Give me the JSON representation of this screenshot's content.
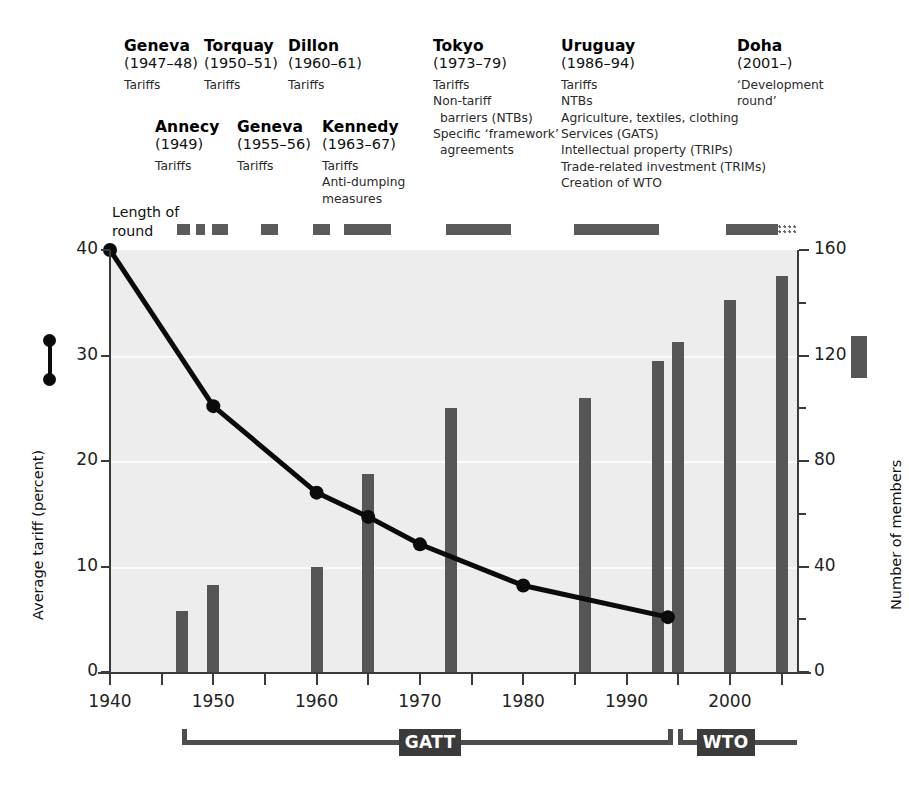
{
  "rounds_top": [
    {
      "name": "Geneva",
      "years": "(1947–48)",
      "topics": [
        "Tariffs"
      ],
      "x": 124,
      "y": 38
    },
    {
      "name": "Torquay",
      "years": "(1950–51)",
      "topics": [
        "Tariffs"
      ],
      "x": 204,
      "y": 38
    },
    {
      "name": "Dillon",
      "years": "(1960–61)",
      "topics": [
        "Tariffs"
      ],
      "x": 288,
      "y": 38
    },
    {
      "name": "Tokyo",
      "years": "(1973–79)",
      "topics": [
        "Tariffs",
        "Non-tariff",
        "barriers (NTBs)",
        "Specific ‘framework’",
        "agreements"
      ],
      "x": 433,
      "y": 38
    },
    {
      "name": "Uruguay",
      "years": "(1986–94)",
      "topics": [
        "Tariffs",
        "NTBs",
        "Agriculture, textiles, clothing",
        "Services (GATS)",
        "Intellectual property (TRIPs)",
        "Trade-related investment (TRIMs)",
        "Creation of WTO"
      ],
      "x": 561,
      "y": 38
    },
    {
      "name": "Doha",
      "years": "(2001–)",
      "topics": [
        "‘Development",
        "round’"
      ],
      "x": 737,
      "y": 38
    }
  ],
  "rounds_bottom": [
    {
      "name": "Annecy",
      "years": "(1949)",
      "topics": [
        "Tariffs"
      ],
      "x": 155,
      "y": 119
    },
    {
      "name": "Geneva",
      "years": "(1955–56)",
      "topics": [
        "Tariffs"
      ],
      "x": 237,
      "y": 119
    },
    {
      "name": "Kennedy",
      "years": "(1963–67)",
      "topics": [
        "Tariffs",
        "Anti-dumping",
        "measures"
      ],
      "x": 322,
      "y": 119
    }
  ],
  "length_of_round": {
    "label_line1": "Length of",
    "label_line2": "round",
    "bars": [
      {
        "round": "Geneva 1947-48",
        "x": 177,
        "w": 13
      },
      {
        "round": "Annecy 1949",
        "x": 196,
        "w": 9
      },
      {
        "round": "Torquay 1950-51",
        "x": 212,
        "w": 16
      },
      {
        "round": "Geneva 1955-56",
        "x": 261,
        "w": 17
      },
      {
        "round": "Dillon 1960-61",
        "x": 313,
        "w": 17
      },
      {
        "round": "Kennedy 1963-67",
        "x": 344,
        "w": 47
      },
      {
        "round": "Tokyo 1973-79",
        "x": 446,
        "w": 65
      },
      {
        "round": "Uruguay 1986-94",
        "x": 574,
        "w": 85
      },
      {
        "round": "Doha 2001-",
        "x": 726,
        "w": 52
      }
    ],
    "doha_dotted": {
      "x": 778,
      "w": 20
    }
  },
  "left_axis": {
    "title": "Average tariff (percent)",
    "ticks": [
      "0",
      "10",
      "20",
      "30",
      "40"
    ],
    "values": [
      0,
      10,
      20,
      30,
      40
    ]
  },
  "right_axis": {
    "title": "Number of members",
    "ticks": [
      "0",
      "40",
      "80",
      "120",
      "160"
    ],
    "values": [
      0,
      40,
      80,
      120,
      160
    ],
    "minor_values": [
      20,
      60,
      100,
      140
    ]
  },
  "x_axis": {
    "ticks": [
      "1940",
      "1950",
      "1960",
      "1970",
      "1980",
      "1990",
      "2000"
    ],
    "values": [
      1940,
      1950,
      1960,
      1970,
      1980,
      1990,
      2000
    ],
    "minor_values": [
      1945,
      1955,
      1965,
      1975,
      1985,
      1995,
      2005
    ],
    "range": [
      1940,
      2006.5
    ]
  },
  "eras": [
    {
      "label": "GATT",
      "start": 1947,
      "end": 1994.5,
      "tag_center": 1971
    },
    {
      "label": "WTO",
      "start": 1995,
      "end": 2006.5,
      "tag_center": 1999.6
    }
  ],
  "legend": {
    "line_series": "Average tariff (percent)",
    "bar_series": "Number of members"
  },
  "colors": {
    "bar": "#565656",
    "line": "#0b0b0b",
    "plot_background": "#ededed",
    "gridline": "#fbfbfb",
    "axis": "#3a3a3a",
    "era": "#4d4d4d",
    "era_tag": "#3b3b3b",
    "round_bar": "#5b5b5b"
  },
  "chart_data": {
    "type": "line",
    "title": "",
    "xlabel": "",
    "ylabel": "Average tariff (percent)",
    "y2label": "Number of members",
    "xlim": [
      1940,
      2006.5
    ],
    "ylim": [
      0,
      40
    ],
    "y2lim": [
      0,
      160
    ],
    "grid": true,
    "legend_position": "outside-left-and-right",
    "series": [
      {
        "name": "Average tariff (percent)",
        "type": "line",
        "axis": "left",
        "marker": "circle",
        "x": [
          1940,
          1950,
          1960,
          1965,
          1970,
          1980,
          1994
        ],
        "values": [
          40.0,
          25.2,
          17.0,
          14.7,
          12.1,
          8.2,
          5.2
        ]
      },
      {
        "name": "Number of members",
        "type": "bar",
        "axis": "right",
        "x": [
          1947,
          1950,
          1960,
          1965,
          1973,
          1986,
          1993,
          1995,
          2000,
          2005
        ],
        "values": [
          23,
          33,
          40,
          75,
          100,
          104,
          118,
          125,
          141,
          150
        ]
      }
    ],
    "annotations": [
      {
        "text": "GATT",
        "x_start": 1947,
        "x_end": 1994.5
      },
      {
        "text": "WTO",
        "x_start": 1995,
        "x_end": 2006.5
      }
    ]
  }
}
